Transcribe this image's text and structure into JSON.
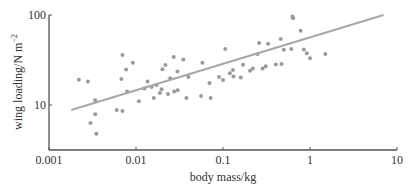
{
  "chart_data": {
    "type": "scatter",
    "title": "",
    "xlabel": "body mass/kg",
    "ylabel": "wing loading/N m⁻²",
    "xscale": "log",
    "yscale": "log",
    "xlim": [
      0.001,
      10
    ],
    "ylim": [
      4,
      100
    ],
    "x_ticks": [
      "0.001",
      "0.01",
      "0.1",
      "1",
      "10"
    ],
    "y_ticks": [
      "10",
      "100"
    ],
    "grid": false,
    "legend": null,
    "series": [
      {
        "name": "species",
        "points": [
          [
            0.0022,
            19.1
          ],
          [
            0.0028,
            18.2
          ],
          [
            0.0034,
            11.3
          ],
          [
            0.0034,
            7.9
          ],
          [
            0.003,
            6.3
          ],
          [
            0.0035,
            4.8
          ],
          [
            0.006,
            8.8
          ],
          [
            0.007,
            8.6
          ],
          [
            0.0068,
            19.4
          ],
          [
            0.007,
            35.9
          ],
          [
            0.0079,
            14.1
          ],
          [
            0.0077,
            24.8
          ],
          [
            0.0092,
            29.5
          ],
          [
            0.0108,
            11.0
          ],
          [
            0.0125,
            15.3
          ],
          [
            0.0136,
            18.2
          ],
          [
            0.0151,
            15.9
          ],
          [
            0.016,
            12.0
          ],
          [
            0.0172,
            16.7
          ],
          [
            0.0188,
            13.6
          ],
          [
            0.0197,
            15.0
          ],
          [
            0.0218,
            27.8
          ],
          [
            0.0201,
            25.0
          ],
          [
            0.0248,
            19.8
          ],
          [
            0.0271,
            34.1
          ],
          [
            0.0233,
            13.3
          ],
          [
            0.0275,
            14.1
          ],
          [
            0.0301,
            14.6
          ],
          [
            0.03,
            23.6
          ],
          [
            0.035,
            32.0
          ],
          [
            0.04,
            20.5
          ],
          [
            0.038,
            12.0
          ],
          [
            0.056,
            12.6
          ],
          [
            0.058,
            29.5
          ],
          [
            0.07,
            17.5
          ],
          [
            0.072,
            12.0
          ],
          [
            0.09,
            20.5
          ],
          [
            0.1,
            18.9
          ],
          [
            0.106,
            42.0
          ],
          [
            0.12,
            22.5
          ],
          [
            0.13,
            24.5
          ],
          [
            0.16,
            20.2
          ],
          [
            0.132,
            20.8
          ],
          [
            0.17,
            28.0
          ],
          [
            0.205,
            24.0
          ],
          [
            0.22,
            25.5
          ],
          [
            0.25,
            37.0
          ],
          [
            0.26,
            49.0
          ],
          [
            0.285,
            25.5
          ],
          [
            0.33,
            48.0
          ],
          [
            0.31,
            27.0
          ],
          [
            0.405,
            28.2
          ],
          [
            0.46,
            54.0
          ],
          [
            0.5,
            41.0
          ],
          [
            0.47,
            28.5
          ],
          [
            0.63,
            96.0
          ],
          [
            0.64,
            92.0
          ],
          [
            0.61,
            42.0
          ],
          [
            0.78,
            67.0
          ],
          [
            0.85,
            41.5
          ],
          [
            0.92,
            37.5
          ],
          [
            1.0,
            33.0
          ],
          [
            1.5,
            37.0
          ]
        ]
      },
      {
        "name": "fit",
        "type": "line",
        "points": [
          [
            0.0018,
            8.8
          ],
          [
            7.0,
            100
          ]
        ]
      }
    ]
  }
}
